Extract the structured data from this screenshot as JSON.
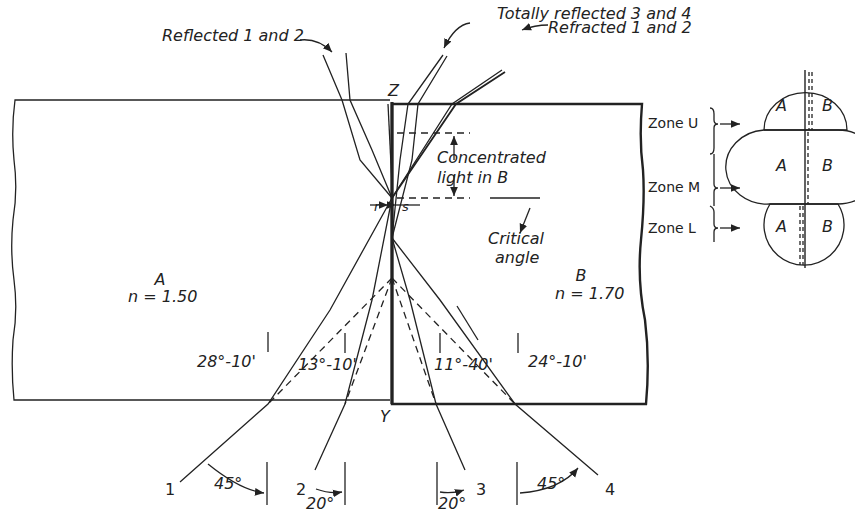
{
  "figure": {
    "callouts": {
      "reflected": "Reflected 1 and 2",
      "totally_reflected": "Totally reflected 3 and 4",
      "refracted": "Refracted 1 and 2",
      "concentrated_line1": "Concentrated",
      "concentrated_line2": "light in B",
      "critical_line1": "Critical",
      "critical_line2": "angle"
    },
    "points": {
      "top": "Z",
      "bottom": "Y",
      "r": "r",
      "s": "s"
    },
    "media": [
      {
        "name": "A",
        "index": "n = 1.50"
      },
      {
        "name": "B",
        "index": "n = 1.70"
      }
    ],
    "angles_inside": [
      "28°-10'",
      "13°-10'",
      "11°-40'",
      "24°-10'"
    ],
    "rays": [
      {
        "id": "1",
        "angle": "45°"
      },
      {
        "id": "2",
        "angle": "20°"
      },
      {
        "id": "3",
        "angle": "20°"
      },
      {
        "id": "4",
        "angle": "45°"
      }
    ],
    "zones": [
      {
        "label": "Zone U",
        "left": "A",
        "right": "B"
      },
      {
        "label": "Zone M",
        "left": "A",
        "right": "B"
      },
      {
        "label": "Zone L",
        "left": "A",
        "right": "B"
      }
    ]
  }
}
